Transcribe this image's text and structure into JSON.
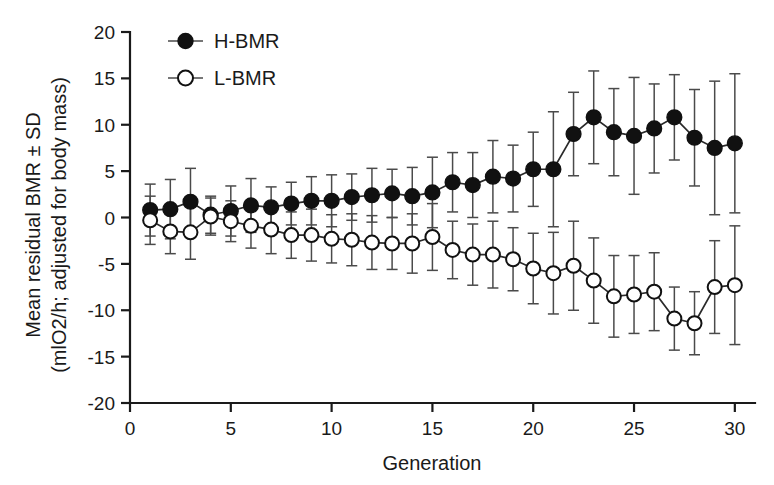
{
  "chart_data": {
    "type": "line",
    "title": "",
    "subtitle": "",
    "xlabel": "Generation",
    "ylabel": "Mean residual BMR ± SD (mlO2/h; adjusted for body mass)",
    "ylabel_line1": "Mean residual BMR ± SD",
    "ylabel_line2": "(mlO2/h; adjusted for body mass)",
    "xlim": [
      0,
      31
    ],
    "ylim": [
      -20,
      20
    ],
    "xticks": [
      0,
      5,
      10,
      15,
      20,
      25,
      30
    ],
    "xtick_labels": [
      "0",
      "5",
      "10",
      "15",
      "20",
      "25",
      "30"
    ],
    "yticks": [
      20,
      15,
      10,
      5,
      0,
      -5,
      -10,
      -15,
      -20
    ],
    "ytick_labels": [
      "20",
      "15",
      "10",
      "5",
      "0",
      "-5",
      "-10",
      "-15",
      "-20"
    ],
    "grid": false,
    "legend_position": "top-left-inside",
    "error_type": "SD",
    "x": [
      1,
      2,
      3,
      4,
      5,
      6,
      7,
      8,
      9,
      10,
      11,
      12,
      13,
      14,
      15,
      16,
      17,
      18,
      19,
      20,
      21,
      22,
      23,
      24,
      25,
      26,
      27,
      28,
      29,
      30
    ],
    "series": [
      {
        "name": "H-BMR",
        "marker": "filled-circle",
        "color": "#111111",
        "values": [
          0.8,
          0.9,
          1.7,
          0.3,
          0.7,
          1.3,
          1.1,
          1.5,
          1.8,
          1.8,
          2.2,
          2.4,
          2.6,
          2.3,
          2.7,
          3.8,
          3.5,
          4.4,
          4.2,
          5.2,
          5.2,
          9.0,
          10.8,
          9.2,
          8.8,
          9.6,
          10.8,
          8.6,
          7.5,
          8.0
        ],
        "errors": [
          2.8,
          3.2,
          3.6,
          2.0,
          2.7,
          2.9,
          2.2,
          2.3,
          2.6,
          2.8,
          2.5,
          2.9,
          2.6,
          3.1,
          3.8,
          3.2,
          3.5,
          3.9,
          3.6,
          4.0,
          6.2,
          4.5,
          5.0,
          4.7,
          6.3,
          4.8,
          4.6,
          5.2,
          7.2,
          7.5
        ]
      },
      {
        "name": "L-BMR",
        "marker": "open-circle",
        "color": "#111111",
        "values": [
          -0.3,
          -1.5,
          -1.6,
          0.1,
          -0.4,
          -0.9,
          -1.3,
          -1.9,
          -1.9,
          -2.3,
          -2.4,
          -2.7,
          -2.8,
          -2.8,
          -2.1,
          -3.5,
          -4.0,
          -4.0,
          -4.5,
          -5.5,
          -6.0,
          -5.2,
          -6.8,
          -8.5,
          -8.3,
          -8.0,
          -10.9,
          -11.4,
          -7.5,
          -7.3
        ],
        "errors": [
          2.6,
          2.4,
          2.9,
          2.0,
          2.2,
          2.4,
          2.6,
          2.5,
          2.8,
          2.6,
          2.8,
          2.9,
          2.8,
          3.2,
          3.6,
          3.1,
          3.3,
          3.6,
          3.4,
          3.8,
          4.4,
          4.8,
          4.6,
          4.4,
          4.2,
          4.2,
          3.4,
          3.4,
          5.0,
          6.4
        ]
      }
    ],
    "legend": [
      {
        "label": "H-BMR",
        "marker": "filled-circle"
      },
      {
        "label": "L-BMR",
        "marker": "open-circle"
      }
    ]
  }
}
